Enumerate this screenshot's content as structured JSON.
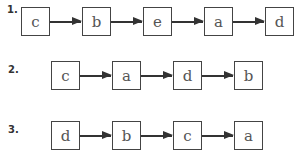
{
  "sequences": [
    {
      "label": "1.",
      "items": [
        "c",
        "b",
        "e",
        "a",
        "d"
      ]
    },
    {
      "label": "2.",
      "items": [
        "c",
        "a",
        "d",
        "b"
      ]
    },
    {
      "label": "3.",
      "items": [
        "d",
        "b",
        "c",
        "a"
      ]
    }
  ]
}
